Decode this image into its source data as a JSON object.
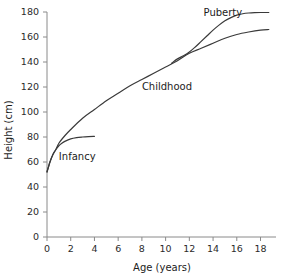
{
  "chart_data": {
    "type": "line",
    "title": "",
    "xlabel": "Age (years)",
    "ylabel": "Height (cm)",
    "xlim": [
      0,
      18.8
    ],
    "ylim": [
      0,
      180
    ],
    "grid": false,
    "legend": "none",
    "xticks": [
      "0",
      "2",
      "4",
      "6",
      "8",
      "10",
      "12",
      "14",
      "16",
      "18"
    ],
    "xtick_values": [
      0,
      2,
      4,
      6,
      8,
      10,
      12,
      14,
      16,
      18
    ],
    "yticks": [
      "0",
      "20",
      "40",
      "60",
      "80",
      "100",
      "120",
      "140",
      "160",
      "180"
    ],
    "ytick_values": [
      0,
      20,
      40,
      60,
      80,
      100,
      120,
      140,
      160,
      180
    ],
    "series": [
      {
        "name": "Main growth curve",
        "x": [
          0,
          0.25,
          0.5,
          0.75,
          1,
          1.5,
          2,
          3,
          4,
          5,
          6,
          7,
          8,
          9,
          10,
          11,
          12,
          13,
          14,
          15,
          16,
          17,
          18,
          18.7
        ],
        "values": [
          52,
          60,
          66,
          70,
          75,
          81,
          86,
          95,
          102,
          109,
          115,
          121,
          126,
          131,
          136,
          141,
          147,
          151,
          155,
          159,
          162,
          164,
          165.5,
          166
        ]
      },
      {
        "name": "Infancy branch",
        "x": [
          0,
          0.25,
          0.5,
          0.75,
          1,
          1.25,
          1.5,
          2,
          2.5,
          3,
          3.5,
          4
        ],
        "values": [
          52,
          60,
          66,
          70,
          73,
          75,
          76.5,
          78.5,
          79.5,
          80,
          80.3,
          80.5
        ]
      },
      {
        "name": "Puberty branch",
        "x": [
          10.5,
          11,
          11.5,
          12,
          12.5,
          13,
          13.5,
          14,
          14.5,
          15,
          15.5,
          16,
          16.5,
          17,
          17.5,
          18,
          18.7
        ],
        "values": [
          139,
          142.5,
          145,
          148,
          152,
          156.5,
          161,
          165.5,
          169.5,
          173,
          175.5,
          177.5,
          178.6,
          179.2,
          179.5,
          179.6,
          179.6
        ]
      }
    ],
    "annotations": [
      {
        "text": "Infancy",
        "x": 1.0,
        "y": 62
      },
      {
        "text": "Childhood",
        "x": 8.0,
        "y": 118
      },
      {
        "text": "Puberty",
        "x": 13.2,
        "y": 177
      }
    ]
  }
}
